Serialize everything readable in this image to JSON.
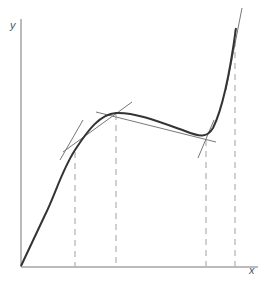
{
  "figure": {
    "axes": {
      "x_label": "x",
      "y_label": "y"
    },
    "colors": {
      "curve": "#333333",
      "tangent": "#777777",
      "axis": "#666666",
      "dashed": "#999999",
      "background": "#ffffff"
    },
    "curve": {
      "description": "cubic-like curve rising from origin, local max, local min, then steep rise",
      "points_px": [
        [
          21,
          266
        ],
        [
          45,
          215
        ],
        [
          65,
          170
        ],
        [
          75,
          150
        ],
        [
          90,
          130
        ],
        [
          116,
          113
        ],
        [
          140,
          112
        ],
        [
          165,
          122
        ],
        [
          190,
          134
        ],
        [
          205,
          137
        ],
        [
          215,
          125
        ],
        [
          225,
          98
        ],
        [
          232,
          65
        ],
        [
          236,
          28
        ]
      ]
    },
    "tangent_lines": [
      {
        "name": "tangent-at-inflection-left",
        "x1_px": 60,
        "y1_px": 160,
        "x2_px": 83,
        "y2_px": 120
      },
      {
        "name": "tangent-at-local-max-steep",
        "x1_px": 63,
        "y1_px": 152,
        "x2_px": 132,
        "y2_px": 102
      },
      {
        "name": "tangent-at-local-max-flat",
        "x1_px": 96,
        "y1_px": 112,
        "x2_px": 216,
        "y2_px": 142
      },
      {
        "name": "tangent-at-local-min",
        "x1_px": 198,
        "y1_px": 158,
        "x2_px": 214,
        "y2_px": 120
      },
      {
        "name": "tangent-at-top",
        "x1_px": 226,
        "y1_px": 90,
        "x2_px": 242,
        "y2_px": 8
      }
    ],
    "dashed_verticals_x_px": [
      75,
      116,
      206,
      235
    ]
  }
}
